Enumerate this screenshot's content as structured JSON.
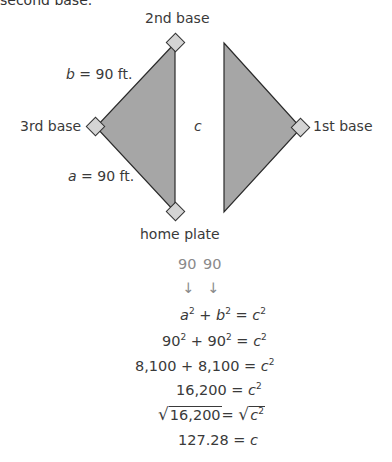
{
  "header_fragment": "second base.",
  "diagram": {
    "labels": {
      "second_base": "2nd base",
      "third_base": "3rd base",
      "first_base": "1st base",
      "home_plate": "home plate",
      "side_b_var": "b",
      "side_b_value": " = 90 ft.",
      "side_a_var": "a",
      "side_a_value": " = 90 ft.",
      "hypotenuse": "c"
    },
    "colors": {
      "triangle_fill": "#a6a6a6",
      "triangle_stroke": "#2b2b2b",
      "base_fill": "#d4d4d4",
      "base_stroke": "#333333"
    }
  },
  "equations": {
    "annot_a": "90",
    "annot_b": "90",
    "arrow": "↓",
    "line1": {
      "a": "a",
      "plus": " + ",
      "b": "b",
      "eq": " = ",
      "c": "c",
      "exp": "2"
    },
    "line2": {
      "left": "90",
      "plus": " + ",
      "mid": "90",
      "eq": " = ",
      "c": "c",
      "exp": "2"
    },
    "line3": {
      "left": "8,100 + 8,100 = ",
      "c": "c",
      "exp": "2"
    },
    "line4": {
      "left": "16,200 = ",
      "c": "c",
      "exp": "2"
    },
    "line5": {
      "radical": "√",
      "inner": "16,200",
      "eq": "= ",
      "c": "c",
      "exp": "2"
    },
    "line6": {
      "text": "127.28 = ",
      "c": "c"
    }
  }
}
